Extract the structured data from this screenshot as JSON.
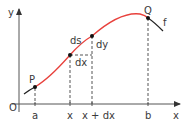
{
  "figure": {
    "type": "arc-length-diagram",
    "axes": {
      "origin_label": "O",
      "x_label": "x",
      "y_label": "y"
    },
    "curve": {
      "label": "f",
      "highlight_color": "#e8413c",
      "base_color": "#222222"
    },
    "points": {
      "start": {
        "label": "P"
      },
      "end": {
        "label": "Q"
      }
    },
    "element": {
      "ds_label": "ds",
      "dx_label": "dx",
      "dy_label": "dy"
    },
    "x_ticks": [
      {
        "label": "a"
      },
      {
        "label": "x"
      },
      {
        "label": "x + dx"
      },
      {
        "label": "b"
      }
    ],
    "colors": {
      "axis": "#555555",
      "dashed": "#555555",
      "text": "#3a3a3a"
    }
  }
}
